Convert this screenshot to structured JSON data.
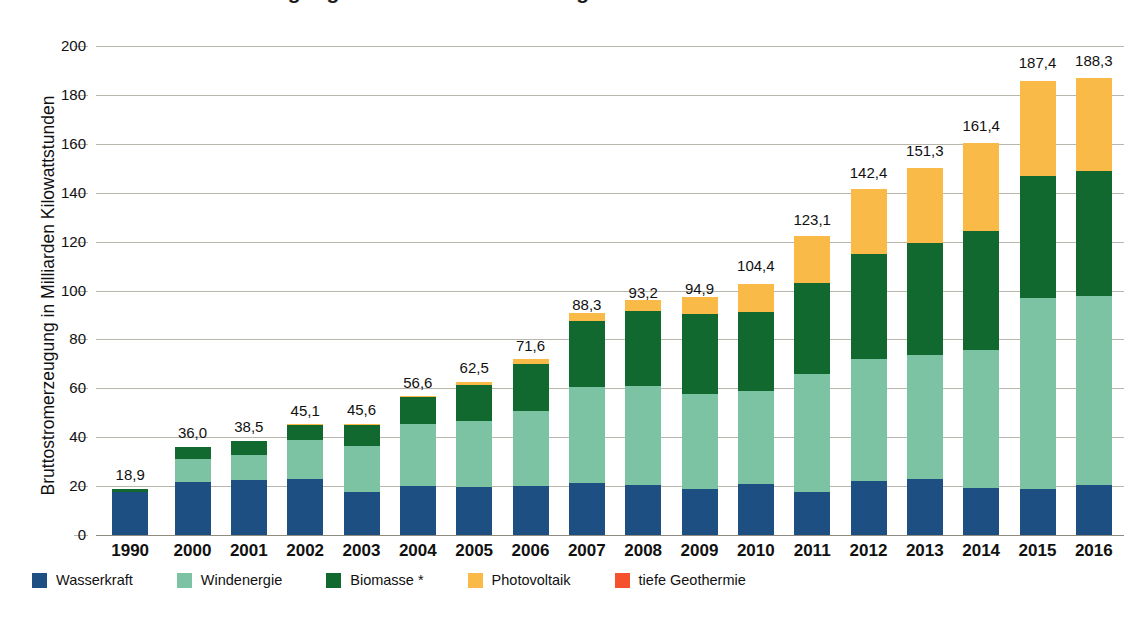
{
  "title": "Bruttostromerzeugung aus erneuerbaren Energien in Deutschland",
  "axis": {
    "ylabel": "Bruttostromerzeugung in Milliarden Kilowattstunden",
    "yticks": [
      "0",
      "20",
      "40",
      "60",
      "80",
      "100",
      "120",
      "140",
      "160",
      "180",
      "200"
    ]
  },
  "legend": {
    "items": [
      {
        "label": "Wasserkraft",
        "color": "#1d4f82"
      },
      {
        "label": "Windenergie",
        "color": "#7cc3a4"
      },
      {
        "label": "Biomasse *",
        "color": "#12692f"
      },
      {
        "label": "Photovoltaik",
        "color": "#f9ba48"
      },
      {
        "label": "tiefe Geothermie",
        "color": "#f4512c"
      }
    ]
  },
  "chart_data": {
    "type": "bar",
    "title": "Bruttostromerzeugung aus erneuerbaren Energien in Deutschland",
    "xlabel": "",
    "ylabel": "Bruttostromerzeugung in Milliarden Kilowattstunden",
    "ylim": [
      0,
      200
    ],
    "ytick_step": 20,
    "grid": true,
    "stacked": true,
    "legend_position": "bottom-left",
    "categories": [
      "1990",
      "2000",
      "2001",
      "2002",
      "2003",
      "2004",
      "2005",
      "2006",
      "2007",
      "2008",
      "2009",
      "2010",
      "2011",
      "2012",
      "2013",
      "2014",
      "2015",
      "2016"
    ],
    "series": [
      {
        "name": "Wasserkraft",
        "color": "#1d4f82",
        "values": [
          17.7,
          21.7,
          22.4,
          23.1,
          17.7,
          19.9,
          19.6,
          20.0,
          21.2,
          20.4,
          19.0,
          21.0,
          17.7,
          22.1,
          23.0,
          19.3,
          18.9,
          20.5
        ]
      },
      {
        "name": "Windenergie",
        "color": "#7cc3a4",
        "values": [
          0.0,
          9.5,
          10.5,
          15.8,
          18.7,
          25.5,
          27.2,
          30.7,
          39.5,
          40.6,
          38.6,
          37.8,
          48.3,
          50.0,
          50.8,
          56.2,
          77.9,
          77.4
        ]
      },
      {
        "name": "Biomasse *",
        "color": "#12692f",
        "values": [
          1.2,
          4.8,
          5.6,
          6.2,
          8.8,
          11.0,
          14.6,
          19.3,
          27.0,
          30.7,
          33.0,
          32.3,
          36.9,
          43.0,
          45.5,
          48.7,
          50.2,
          50.9
        ]
      },
      {
        "name": "Photovoltaik",
        "color": "#f9ba48",
        "values": [
          0.0,
          0.0,
          0.0,
          0.2,
          0.3,
          0.6,
          1.3,
          2.2,
          3.1,
          4.4,
          6.6,
          11.7,
          19.6,
          26.4,
          31.0,
          36.1,
          38.7,
          38.1
        ]
      },
      {
        "name": "tiefe Geothermie",
        "color": "#f4512c",
        "values": [
          0.0,
          0.0,
          0.0,
          0.0,
          0.0,
          0.0,
          0.0,
          0.0,
          0.0,
          0.0,
          0.0,
          0.0,
          0.0,
          0.0,
          0.0,
          0.0,
          0.0,
          0.0
        ]
      }
    ],
    "totals_display": [
      "18,9",
      "36,0",
      "38,5",
      "45,1",
      "45,6",
      "56,6",
      "62,5",
      "71,6",
      "88,3",
      "93,2",
      "94,9",
      "104,4",
      "123,1",
      "142,4",
      "151,3",
      "161,4",
      "187,4",
      "188,3"
    ],
    "totals": [
      18.9,
      36.0,
      38.5,
      45.1,
      45.6,
      56.6,
      62.5,
      71.6,
      88.3,
      93.2,
      94.9,
      104.4,
      123.1,
      142.4,
      151.3,
      161.4,
      187.4,
      188.3
    ]
  }
}
